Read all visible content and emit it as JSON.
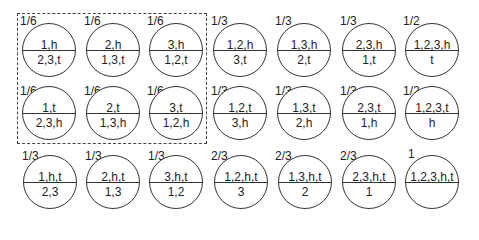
{
  "diagram": {
    "grouping_box": {
      "style": "dashed",
      "contains": "nodes with probability 1/6 (rows 1-2, columns 1-3)"
    },
    "nodes": [
      {
        "prob": "1/6",
        "top": "1,h",
        "bottom": "2,3,t"
      },
      {
        "prob": "1/6",
        "top": "2,h",
        "bottom": "1,3,t"
      },
      {
        "prob": "1/6",
        "top": "3,h",
        "bottom": "1,2,t"
      },
      {
        "prob": "1/3",
        "top": "1,2,h",
        "bottom": "3,t"
      },
      {
        "prob": "1/3",
        "top": "1,3,h",
        "bottom": "2,t"
      },
      {
        "prob": "1/3",
        "top": "2,3,h",
        "bottom": "1,t"
      },
      {
        "prob": "1/2",
        "top": "1,2,3,h",
        "bottom": "t"
      },
      {
        "prob": "1/6",
        "top": "1,t",
        "bottom": "2,3,h"
      },
      {
        "prob": "1/6",
        "top": "2,t",
        "bottom": "1,3,h"
      },
      {
        "prob": "1/6",
        "top": "3,t",
        "bottom": "1,2,h"
      },
      {
        "prob": "1/3",
        "top": "1,2,t",
        "bottom": "3,h"
      },
      {
        "prob": "1/3",
        "top": "1,3,t",
        "bottom": "2,h"
      },
      {
        "prob": "1/3",
        "top": "2,3,t",
        "bottom": "1,h"
      },
      {
        "prob": "1/2",
        "top": "1,2,3,t",
        "bottom": "h"
      },
      {
        "prob": "1/3",
        "top": "1,h,t",
        "bottom": "2,3"
      },
      {
        "prob": "1/3",
        "top": "2,h,t",
        "bottom": "1,3"
      },
      {
        "prob": "1/3",
        "top": "3,h,t",
        "bottom": "1,2"
      },
      {
        "prob": "2/3",
        "top": "1,2,h,t",
        "bottom": "3"
      },
      {
        "prob": "2/3",
        "top": "1,3,h,t",
        "bottom": "2"
      },
      {
        "prob": "2/3",
        "top": "2,3,h,t",
        "bottom": "1"
      },
      {
        "prob": "1",
        "top": "1,2,3,h,t",
        "bottom": ""
      }
    ]
  }
}
